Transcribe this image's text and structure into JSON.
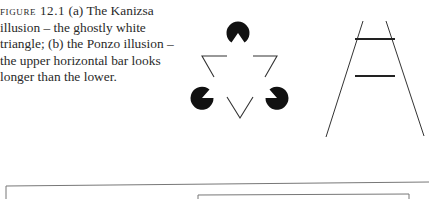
{
  "caption": {
    "label": "FIGURE 12.1",
    "text": " (a) The Kanizsa illusion – the ghostly white triangle; (b) the Ponzo illusion – the upper horizontal bar looks longer than the lower."
  },
  "figures": {
    "a": "Kanizsa triangle illusion",
    "b": "Ponzo illusion"
  },
  "colors": {
    "ink": "#111111",
    "line": "#333333",
    "frame": "#777777"
  }
}
